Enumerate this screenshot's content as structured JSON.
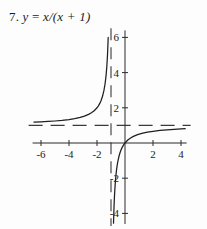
{
  "figure": {
    "label": "7.",
    "equation_lhs": "y",
    "equation_eq": "=",
    "equation_rhs": "x/(x + 1)",
    "caption_full": "7. y = x/(x + 1)",
    "background_color": "#fdfdfd",
    "ink_color": "#1f1f1f"
  },
  "chart_data": {
    "type": "line",
    "title": "7. y = x/(x + 1)",
    "xlabel": "",
    "ylabel": "",
    "function": "y = x/(x + 1)",
    "xlim": [
      -6.6,
      4.4
    ],
    "ylim": [
      -4.6,
      6.4
    ],
    "grid": false,
    "legend": null,
    "x_ticks": [
      -6,
      -4,
      -2,
      2,
      4
    ],
    "x_tick_labels": [
      "-6",
      "-4",
      "-2",
      "2",
      "4"
    ],
    "y_ticks": [
      6,
      4,
      2,
      -2,
      -4
    ],
    "y_tick_labels": [
      "6",
      "4",
      "2",
      "-2",
      "-4"
    ],
    "asymptotes": [
      {
        "name": "vertical-asymptote",
        "type": "vertical",
        "value": -1,
        "style": "dashed"
      },
      {
        "name": "horizontal-asymptote",
        "type": "horizontal",
        "value": 1,
        "style": "dashed"
      }
    ],
    "series": [
      {
        "name": "left-branch",
        "domain": [
          -6.5,
          -1.08
        ],
        "points": [
          [
            -6.5,
            1.182
          ],
          [
            -6.0,
            1.2
          ],
          [
            -5.5,
            1.222
          ],
          [
            -5.0,
            1.25
          ],
          [
            -4.5,
            1.286
          ],
          [
            -4.0,
            1.333
          ],
          [
            -3.6,
            1.385
          ],
          [
            -3.2,
            1.455
          ],
          [
            -2.9,
            1.526
          ],
          [
            -2.6,
            1.625
          ],
          [
            -2.4,
            1.714
          ],
          [
            -2.2,
            1.833
          ],
          [
            -2.0,
            2.0
          ],
          [
            -1.9,
            2.111
          ],
          [
            -1.8,
            2.25
          ],
          [
            -1.7,
            2.429
          ],
          [
            -1.6,
            2.667
          ],
          [
            -1.5,
            3.0
          ],
          [
            -1.42,
            3.381
          ],
          [
            -1.35,
            3.857
          ],
          [
            -1.3,
            4.333
          ],
          [
            -1.25,
            5.0
          ],
          [
            -1.2,
            6.0
          ]
        ]
      },
      {
        "name": "right-branch",
        "domain": [
          -0.88,
          4.3
        ],
        "points": [
          [
            -0.82,
            -4.556
          ],
          [
            -0.8,
            -4.0
          ],
          [
            -0.78,
            -3.545
          ],
          [
            -0.75,
            -3.0
          ],
          [
            -0.72,
            -2.571
          ],
          [
            -0.68,
            -2.125
          ],
          [
            -0.64,
            -1.778
          ],
          [
            -0.6,
            -1.5
          ],
          [
            -0.55,
            -1.222
          ],
          [
            -0.5,
            -1.0
          ],
          [
            -0.42,
            -0.724
          ],
          [
            -0.35,
            -0.538
          ],
          [
            -0.28,
            -0.389
          ],
          [
            -0.2,
            -0.25
          ],
          [
            -0.1,
            -0.111
          ],
          [
            0.0,
            0.0
          ],
          [
            0.2,
            0.167
          ],
          [
            0.4,
            0.286
          ],
          [
            0.6,
            0.375
          ],
          [
            0.9,
            0.474
          ],
          [
            1.2,
            0.545
          ],
          [
            1.6,
            0.615
          ],
          [
            2.0,
            0.667
          ],
          [
            2.5,
            0.714
          ],
          [
            3.0,
            0.75
          ],
          [
            3.5,
            0.778
          ],
          [
            4.0,
            0.8
          ],
          [
            4.3,
            0.811
          ]
        ]
      }
    ]
  }
}
